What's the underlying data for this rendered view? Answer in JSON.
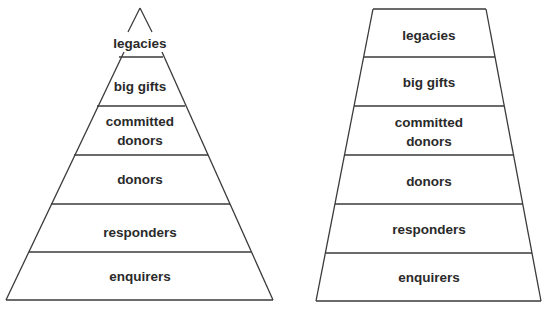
{
  "diagrams": [
    {
      "name": "pyramid",
      "levels": [
        {
          "label": "legacies"
        },
        {
          "label": "big gifts"
        },
        {
          "label": "committed",
          "label2": "donors"
        },
        {
          "label": "donors"
        },
        {
          "label": "responders"
        },
        {
          "label": "enquirers"
        }
      ]
    },
    {
      "name": "trapezoid",
      "levels": [
        {
          "label": "legacies"
        },
        {
          "label": "big gifts"
        },
        {
          "label": "committed",
          "label2": "donors"
        },
        {
          "label": "donors"
        },
        {
          "label": "responders"
        },
        {
          "label": "enquirers"
        }
      ]
    }
  ],
  "colors": {
    "line": "#3a3a3a",
    "text": "#2a2a2a",
    "background": "#ffffff"
  }
}
